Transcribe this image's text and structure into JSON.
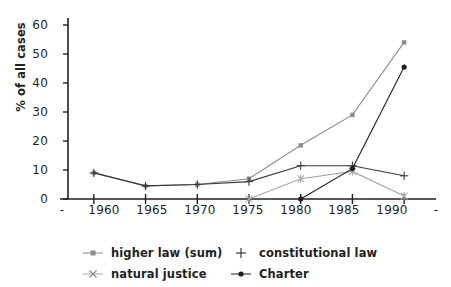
{
  "chart_data": {
    "type": "line",
    "title": "",
    "xlabel": "",
    "ylabel": "% of all cases",
    "x": [
      1960,
      1965,
      1970,
      1975,
      1980,
      1985,
      1990
    ],
    "xtick_labels": [
      "1960",
      "1965",
      "1970",
      "1975",
      "1980",
      "1985",
      "1990"
    ],
    "xlim": [
      1957.5,
      1992.5
    ],
    "ylim": [
      0,
      60
    ],
    "ytick_labels": [
      "0",
      "10",
      "20",
      "30",
      "40",
      "50",
      "60"
    ],
    "ytick_values": [
      0,
      10,
      20,
      30,
      40,
      50,
      60
    ],
    "grid": false,
    "legend_position": "bottom",
    "axis_end_dash_left": "-",
    "axis_end_dash_right": "-",
    "series": [
      {
        "name": "higher law (sum)",
        "marker": "square",
        "color": "#8c8c8c",
        "x": [
          1960,
          1965,
          1970,
          1975,
          1980,
          1985,
          1990
        ],
        "values": [
          9,
          4.5,
          5,
          7,
          18.5,
          29,
          54
        ]
      },
      {
        "name": "constitutional law",
        "marker": "plus",
        "color": "#3a3a3a",
        "x": [
          1960,
          1965,
          1970,
          1975,
          1980,
          1985,
          1990
        ],
        "values": [
          9,
          4.5,
          5,
          6,
          11.5,
          11.5,
          8
        ]
      },
      {
        "name": "natural justice",
        "marker": "cross",
        "color": "#a6a6a6",
        "x": [
          1975,
          1980,
          1985,
          1990
        ],
        "values": [
          0,
          7,
          9.5,
          1
        ]
      },
      {
        "name": "Charter",
        "marker": "circle",
        "color": "#231f20",
        "x": [
          1980,
          1985,
          1990
        ],
        "values": [
          0,
          10.5,
          45.5
        ]
      }
    ]
  },
  "legend": {
    "items": [
      {
        "label": "higher law (sum)",
        "marker": "square-line-marker"
      },
      {
        "label": "constitutional law",
        "marker": "plus-marker"
      },
      {
        "label": "natural justice",
        "marker": "cross-marker"
      },
      {
        "label": "Charter",
        "marker": "circle-line-marker"
      }
    ]
  }
}
